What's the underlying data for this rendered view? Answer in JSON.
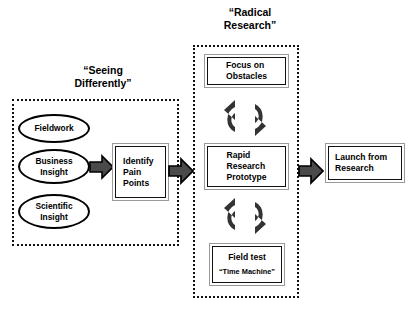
{
  "diagram": {
    "background_color": "#ffffff",
    "stroke_color": "#000000",
    "arrow_fill_color": "#4a4a4a",
    "box_border_color": "#9a9a9a"
  },
  "groups": {
    "seeing": {
      "title": "“Seeing\nDifferently”",
      "inputs": [
        {
          "label": "Fieldwork"
        },
        {
          "label": "Business\nInsight"
        },
        {
          "label": "Scientific\nInsight"
        }
      ],
      "output_box": {
        "label": "Identify\nPain\nPoints"
      }
    },
    "radical": {
      "title": "“Radical\nResearch”",
      "steps": [
        {
          "label": "Focus on\nObstacles",
          "sublabel": ""
        },
        {
          "label": "Rapid\nResearch\nPrototype",
          "sublabel": ""
        },
        {
          "label": "Field test",
          "sublabel": "“Time Machine”"
        }
      ]
    }
  },
  "outcome": {
    "box": {
      "label": "Launch from\nResearch"
    }
  },
  "connectors": {
    "inputs_to_identify": "block-arrow-right",
    "seeing_to_radical": "block-arrow-right",
    "radical_to_launch": "block-arrow-right",
    "focus_to_rapid": "cycle-arrows",
    "rapid_to_field": "cycle-arrows"
  }
}
